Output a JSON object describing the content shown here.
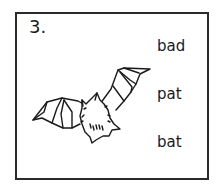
{
  "question": {
    "number": "3.",
    "image_subject": "bat-icon",
    "options": [
      {
        "label": "bad"
      },
      {
        "label": "pat"
      },
      {
        "label": "bat"
      }
    ]
  },
  "colors": {
    "ink": "#1a1a1a",
    "border": "#2a2a2a",
    "background": "#ffffff"
  }
}
